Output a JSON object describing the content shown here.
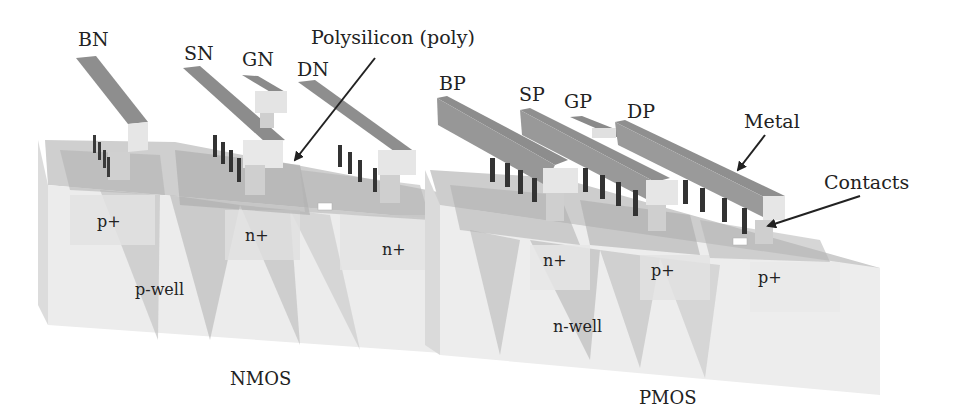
{
  "figure": {
    "type": "3D cross-section diagram of CMOS inverter structure",
    "colors": {
      "background": "#ffffff",
      "metal": "#8f8f8f",
      "metal_top": "#9a9a9a",
      "contact_dark": "#3a3a3a",
      "contact_light": "#c8c8c8",
      "substrate_light": "#ececec",
      "diffusion": "#d6d6d6",
      "well_shade": "#b5b5b5",
      "text": "#222222",
      "arrow": "#222222"
    }
  },
  "terminals": {
    "nmos": [
      {
        "id": "BN",
        "label": "BN"
      },
      {
        "id": "SN",
        "label": "SN"
      },
      {
        "id": "GN",
        "label": "GN"
      },
      {
        "id": "DN",
        "label": "DN"
      }
    ],
    "pmos": [
      {
        "id": "BP",
        "label": "BP"
      },
      {
        "id": "SP",
        "label": "SP"
      },
      {
        "id": "GP",
        "label": "GP"
      },
      {
        "id": "DP",
        "label": "DP"
      }
    ]
  },
  "callouts": {
    "poly": "Polysilicon (poly)",
    "metal": "Metal",
    "contacts": "Contacts"
  },
  "regions": {
    "nmos_body_diff": "p+",
    "nmos_source": "n+",
    "nmos_drain": "n+",
    "pwell": "p-well",
    "pmos_body_diff": "n+",
    "pmos_source": "p+",
    "pmos_drain": "p+",
    "nwell": "n-well"
  },
  "devices": {
    "nmos": "NMOS",
    "pmos": "PMOS"
  }
}
